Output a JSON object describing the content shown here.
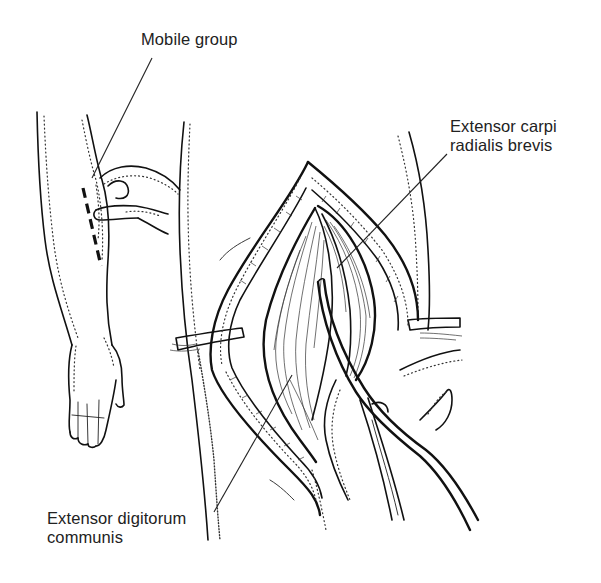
{
  "figure": {
    "labels": {
      "mobile_group": "Mobile group",
      "ecrb_line1": "Extensor carpi",
      "ecrb_line2": "radialis brevis",
      "edc_line1": "Extensor digitorum",
      "edc_line2": "communis"
    },
    "panels": {
      "left": "Forearm with dashed incision line; examiner's fingers grasping the mobile wad",
      "right": "Exposed surgical field with retractors, muscles and curved dissecting instrument"
    },
    "colors": {
      "ink": "#111111",
      "label_text": "#222222",
      "background": "#ffffff"
    }
  }
}
